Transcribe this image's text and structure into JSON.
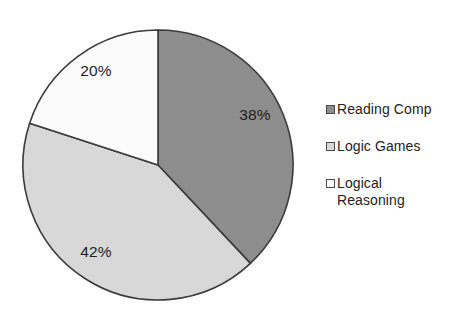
{
  "chart_data": {
    "type": "pie",
    "title": "",
    "subtitle": "",
    "xlabel": "",
    "ylabel": "",
    "grid": false,
    "legend_position": "right",
    "start_angle_deg": 0,
    "direction": "clockwise",
    "categories": [
      "Reading Comp",
      "Logic Games",
      "Logical Reasoning"
    ],
    "values": [
      38,
      42,
      20
    ],
    "value_unit": "%",
    "data_labels": [
      "38%",
      "42%",
      "20%"
    ],
    "colors": [
      "#8d8d8d",
      "#d8d8d8",
      "#fbfbfb"
    ],
    "slices": [
      {
        "label": "Reading Comp",
        "value": 38,
        "data_label": "38%",
        "color": "#8d8d8d",
        "start_deg": 0,
        "end_deg": 136.8,
        "label_x": 255,
        "label_y": 116
      },
      {
        "label": "Logic Games",
        "value": 42,
        "data_label": "42%",
        "color": "#d8d8d8",
        "start_deg": 136.8,
        "end_deg": 288.0,
        "label_x": 96,
        "label_y": 253
      },
      {
        "label": "Logical Reasoning",
        "value": 20,
        "data_label": "20%",
        "color": "#fbfbfb",
        "start_deg": 288.0,
        "end_deg": 360.0,
        "label_x": 96,
        "label_y": 72
      }
    ],
    "geometry": {
      "center_x": 158,
      "center_y": 165,
      "radius": 135
    },
    "outline_color": "#3b3b3b",
    "background_color": "#ffffff"
  },
  "legend": {
    "items": [
      {
        "label": "Reading Comp",
        "swatch_color": "#8d8d8d"
      },
      {
        "label": "Logic Games",
        "swatch_color": "#d8d8d8"
      },
      {
        "label": "Logical\nReasoning",
        "swatch_color": "#fefefe"
      }
    ]
  }
}
